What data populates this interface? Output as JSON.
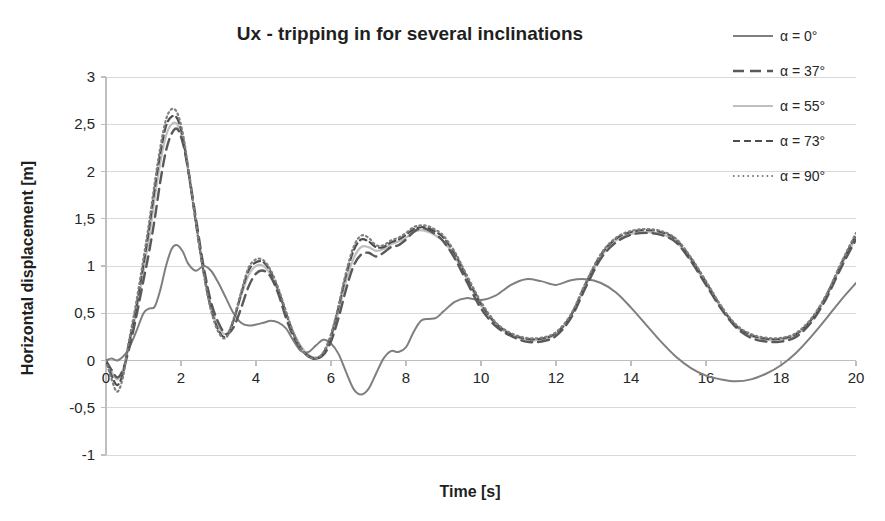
{
  "chart_data": {
    "type": "line",
    "title": "Ux - tripping in for several inclinations",
    "xlabel": "Time [s]",
    "ylabel": "Horizontal displacement [m]",
    "xlim": [
      0,
      20
    ],
    "ylim": [
      -1,
      3
    ],
    "grid": true,
    "legend_position": "right",
    "xticks": [
      0,
      2,
      4,
      6,
      8,
      10,
      12,
      14,
      16,
      18,
      20
    ],
    "xtick_labels": [
      "0",
      "2",
      "4",
      "6",
      "8",
      "10",
      "12",
      "14",
      "16",
      "18",
      "20"
    ],
    "yticks": [
      -1,
      -0.5,
      0,
      0.5,
      1,
      1.5,
      2,
      2.5,
      3
    ],
    "ytick_labels": [
      "-1",
      "-0,5",
      "0",
      "0,5",
      "1",
      "1,5",
      "2",
      "2,5",
      "3"
    ],
    "decimal_separator": ",",
    "series": [
      {
        "name": "α = 0°",
        "legend_label": "α = 0°",
        "style": "solid",
        "color": "#7f7f7f",
        "width": 2.0,
        "dasharray": "none",
        "x": [
          0,
          0.15,
          0.3,
          0.45,
          0.6,
          0.8,
          1.0,
          1.15,
          1.3,
          1.45,
          1.6,
          1.75,
          1.9,
          2.05,
          2.2,
          2.4,
          2.6,
          2.8,
          3.0,
          3.2,
          3.4,
          3.6,
          3.8,
          4.0,
          4.2,
          4.4,
          4.6,
          4.8,
          5.0,
          5.2,
          5.4,
          5.6,
          5.8,
          6.0,
          6.2,
          6.4,
          6.6,
          6.8,
          7.0,
          7.2,
          7.4,
          7.6,
          7.8,
          8.0,
          8.2,
          8.4,
          8.6,
          8.8,
          9.0,
          9.3,
          9.6,
          10.0,
          10.4,
          10.8,
          11.2,
          11.6,
          12.0,
          12.4,
          12.8,
          13.2,
          13.6,
          14.0,
          14.4,
          14.8,
          15.2,
          15.6,
          16.0,
          16.4,
          16.8,
          17.2,
          17.6,
          18.0,
          18.4,
          18.8,
          19.2,
          19.6,
          20.0
        ],
        "y": [
          0.0,
          0.02,
          0.0,
          0.04,
          0.12,
          0.3,
          0.5,
          0.55,
          0.57,
          0.75,
          1.0,
          1.18,
          1.22,
          1.15,
          1.02,
          0.95,
          1.0,
          0.95,
          0.82,
          0.66,
          0.5,
          0.4,
          0.37,
          0.38,
          0.4,
          0.42,
          0.4,
          0.34,
          0.21,
          0.1,
          0.09,
          0.16,
          0.22,
          0.18,
          0.07,
          -0.12,
          -0.3,
          -0.36,
          -0.3,
          -0.14,
          0.02,
          0.1,
          0.09,
          0.14,
          0.3,
          0.42,
          0.44,
          0.45,
          0.52,
          0.62,
          0.66,
          0.64,
          0.69,
          0.8,
          0.86,
          0.84,
          0.8,
          0.85,
          0.86,
          0.82,
          0.72,
          0.56,
          0.38,
          0.2,
          0.04,
          -0.08,
          -0.16,
          -0.2,
          -0.22,
          -0.2,
          -0.14,
          -0.05,
          0.08,
          0.25,
          0.44,
          0.64,
          0.82
        ],
        "peak_values": {
          "first_peak_t": 1.85,
          "first_peak_y": 1.22,
          "second_peak_t": 8.4,
          "second_peak_y": 0.86,
          "third_peak_t": 14.1,
          "third_peak_y": 0.86,
          "min_t": 6.8,
          "min_y": -0.36,
          "end_t": 20,
          "end_y": 0.82
        }
      },
      {
        "name": "α = 37°",
        "legend_label": "α = 37°",
        "style": "long-dash",
        "color": "#595959",
        "width": 2.4,
        "dasharray": "11,6",
        "x": [
          0,
          0.15,
          0.3,
          0.45,
          0.6,
          0.8,
          1.0,
          1.15,
          1.3,
          1.45,
          1.6,
          1.75,
          1.9,
          2.05,
          2.2,
          2.4,
          2.6,
          2.8,
          3.0,
          3.2,
          3.4,
          3.6,
          3.8,
          4.0,
          4.2,
          4.4,
          4.6,
          4.8,
          5.0,
          5.2,
          5.4,
          5.6,
          5.8,
          6.0,
          6.2,
          6.4,
          6.6,
          6.8,
          7.0,
          7.2,
          7.4,
          7.6,
          7.8,
          8.0,
          8.2,
          8.4,
          8.6,
          8.8,
          9.0,
          9.3,
          9.6,
          10.0,
          10.4,
          10.8,
          11.2,
          11.6,
          12.0,
          12.4,
          12.8,
          13.2,
          13.6,
          14.0,
          14.4,
          14.8,
          15.2,
          15.6,
          16.0,
          16.4,
          16.8,
          17.2,
          17.6,
          18.0,
          18.4,
          18.8,
          19.2,
          19.6,
          20.0
        ],
        "y": [
          0.0,
          -0.1,
          -0.18,
          -0.1,
          0.1,
          0.45,
          0.85,
          1.15,
          1.5,
          1.9,
          2.22,
          2.4,
          2.45,
          2.3,
          2.0,
          1.5,
          1.0,
          0.62,
          0.4,
          0.28,
          0.35,
          0.55,
          0.78,
          0.92,
          0.95,
          0.88,
          0.7,
          0.45,
          0.25,
          0.12,
          0.05,
          0.02,
          0.06,
          0.2,
          0.45,
          0.75,
          1.0,
          1.12,
          1.14,
          1.1,
          1.14,
          1.2,
          1.22,
          1.28,
          1.36,
          1.4,
          1.38,
          1.33,
          1.26,
          1.08,
          0.85,
          0.55,
          0.36,
          0.26,
          0.2,
          0.2,
          0.26,
          0.45,
          0.78,
          1.08,
          1.25,
          1.33,
          1.35,
          1.33,
          1.25,
          1.05,
          0.8,
          0.55,
          0.35,
          0.24,
          0.2,
          0.2,
          0.25,
          0.4,
          0.65,
          0.98,
          1.28
        ],
        "peak_values": {
          "first_peak_t": 1.85,
          "first_peak_y": 2.45,
          "second_peak_t": 8.4,
          "second_peak_y": 1.4,
          "third_peak_t": 14.4,
          "third_peak_y": 1.35,
          "min_t": 0.3,
          "min_y": -0.18,
          "end_t": 20,
          "end_y": 1.28
        }
      },
      {
        "name": "α = 55°",
        "legend_label": "α = 55°",
        "style": "light-solid",
        "color": "#bfbfbf",
        "width": 2.2,
        "dasharray": "none",
        "x": [
          0,
          0.15,
          0.3,
          0.45,
          0.6,
          0.8,
          1.0,
          1.15,
          1.3,
          1.45,
          1.6,
          1.75,
          1.9,
          2.05,
          2.2,
          2.4,
          2.6,
          2.8,
          3.0,
          3.2,
          3.4,
          3.6,
          3.8,
          4.0,
          4.2,
          4.4,
          4.6,
          4.8,
          5.0,
          5.2,
          5.4,
          5.6,
          5.8,
          6.0,
          6.2,
          6.4,
          6.6,
          6.8,
          7.0,
          7.2,
          7.4,
          7.6,
          7.8,
          8.0,
          8.2,
          8.4,
          8.6,
          8.8,
          9.0,
          9.3,
          9.6,
          10.0,
          10.4,
          10.8,
          11.2,
          11.6,
          12.0,
          12.4,
          12.8,
          13.2,
          13.6,
          14.0,
          14.4,
          14.8,
          15.2,
          15.6,
          16.0,
          16.4,
          16.8,
          17.2,
          17.6,
          18.0,
          18.4,
          18.8,
          19.2,
          19.6,
          20.0
        ],
        "y": [
          0.0,
          -0.12,
          -0.2,
          -0.1,
          0.14,
          0.5,
          0.95,
          1.3,
          1.72,
          2.1,
          2.38,
          2.5,
          2.5,
          2.33,
          1.98,
          1.45,
          0.95,
          0.58,
          0.36,
          0.28,
          0.42,
          0.68,
          0.9,
          1.0,
          1.0,
          0.9,
          0.72,
          0.5,
          0.3,
          0.15,
          0.06,
          0.03,
          0.08,
          0.24,
          0.52,
          0.84,
          1.08,
          1.2,
          1.2,
          1.16,
          1.18,
          1.23,
          1.26,
          1.3,
          1.36,
          1.38,
          1.36,
          1.32,
          1.26,
          1.1,
          0.88,
          0.58,
          0.38,
          0.27,
          0.22,
          0.22,
          0.28,
          0.47,
          0.8,
          1.1,
          1.27,
          1.34,
          1.36,
          1.34,
          1.26,
          1.06,
          0.81,
          0.56,
          0.36,
          0.26,
          0.22,
          0.22,
          0.27,
          0.42,
          0.67,
          1.0,
          1.3
        ],
        "peak_values": {
          "first_peak_t": 1.8,
          "first_peak_y": 2.51,
          "second_peak_t": 8.4,
          "second_peak_y": 1.38,
          "third_peak_t": 14.4,
          "third_peak_y": 1.36,
          "min_t": 0.3,
          "min_y": -0.2,
          "end_t": 20,
          "end_y": 1.3
        }
      },
      {
        "name": "α = 73°",
        "legend_label": "α = 73°",
        "style": "dashed",
        "color": "#4d4d4d",
        "width": 2.2,
        "dasharray": "7,4",
        "x": [
          0,
          0.15,
          0.3,
          0.45,
          0.6,
          0.8,
          1.0,
          1.15,
          1.3,
          1.45,
          1.6,
          1.75,
          1.9,
          2.05,
          2.2,
          2.4,
          2.6,
          2.8,
          3.0,
          3.2,
          3.4,
          3.6,
          3.8,
          4.0,
          4.2,
          4.4,
          4.6,
          4.8,
          5.0,
          5.2,
          5.4,
          5.6,
          5.8,
          6.0,
          6.2,
          6.4,
          6.6,
          6.8,
          7.0,
          7.2,
          7.4,
          7.6,
          7.8,
          8.0,
          8.2,
          8.4,
          8.6,
          8.8,
          9.0,
          9.3,
          9.6,
          10.0,
          10.4,
          10.8,
          11.2,
          11.6,
          12.0,
          12.4,
          12.8,
          13.2,
          13.6,
          14.0,
          14.4,
          14.8,
          15.2,
          15.6,
          16.0,
          16.4,
          16.8,
          17.2,
          17.6,
          18.0,
          18.4,
          18.8,
          19.2,
          19.6,
          20.0
        ],
        "y": [
          0.0,
          -0.16,
          -0.26,
          -0.14,
          0.16,
          0.55,
          1.02,
          1.4,
          1.82,
          2.2,
          2.48,
          2.58,
          2.56,
          2.36,
          2.0,
          1.45,
          0.94,
          0.55,
          0.32,
          0.25,
          0.42,
          0.7,
          0.95,
          1.04,
          1.04,
          0.93,
          0.74,
          0.5,
          0.28,
          0.13,
          0.04,
          0.02,
          0.08,
          0.26,
          0.56,
          0.9,
          1.16,
          1.28,
          1.26,
          1.2,
          1.2,
          1.25,
          1.28,
          1.33,
          1.39,
          1.41,
          1.4,
          1.36,
          1.3,
          1.13,
          0.9,
          0.6,
          0.39,
          0.28,
          0.23,
          0.23,
          0.29,
          0.48,
          0.82,
          1.12,
          1.29,
          1.36,
          1.38,
          1.36,
          1.28,
          1.08,
          0.83,
          0.57,
          0.37,
          0.27,
          0.23,
          0.23,
          0.28,
          0.43,
          0.68,
          1.02,
          1.33
        ],
        "peak_values": {
          "first_peak_t": 1.78,
          "first_peak_y": 2.58,
          "second_peak_t": 8.4,
          "second_peak_y": 1.41,
          "third_peak_t": 14.4,
          "third_peak_y": 1.38,
          "min_t": 0.3,
          "min_y": -0.26,
          "end_t": 20,
          "end_y": 1.33
        }
      },
      {
        "name": "α = 90°",
        "legend_label": "α = 90°",
        "style": "dotted",
        "color": "#808080",
        "width": 2.2,
        "dasharray": "1.6,3.2",
        "x": [
          0,
          0.15,
          0.3,
          0.45,
          0.6,
          0.8,
          1.0,
          1.15,
          1.3,
          1.45,
          1.6,
          1.75,
          1.9,
          2.05,
          2.2,
          2.4,
          2.6,
          2.8,
          3.0,
          3.2,
          3.4,
          3.6,
          3.8,
          4.0,
          4.2,
          4.4,
          4.6,
          4.8,
          5.0,
          5.2,
          5.4,
          5.6,
          5.8,
          6.0,
          6.2,
          6.4,
          6.6,
          6.8,
          7.0,
          7.2,
          7.4,
          7.6,
          7.8,
          8.0,
          8.2,
          8.4,
          8.6,
          8.8,
          9.0,
          9.3,
          9.6,
          10.0,
          10.4,
          10.8,
          11.2,
          11.6,
          12.0,
          12.4,
          12.8,
          13.2,
          13.6,
          14.0,
          14.4,
          14.8,
          15.2,
          15.6,
          16.0,
          16.4,
          16.8,
          17.2,
          17.6,
          18.0,
          18.4,
          18.8,
          19.2,
          19.6,
          20.0
        ],
        "y": [
          0.0,
          -0.2,
          -0.33,
          -0.18,
          0.18,
          0.6,
          1.08,
          1.46,
          1.88,
          2.26,
          2.55,
          2.66,
          2.62,
          2.4,
          2.02,
          1.46,
          0.93,
          0.53,
          0.3,
          0.24,
          0.44,
          0.72,
          0.98,
          1.07,
          1.06,
          0.95,
          0.76,
          0.52,
          0.29,
          0.13,
          0.04,
          0.02,
          0.09,
          0.28,
          0.58,
          0.93,
          1.2,
          1.32,
          1.3,
          1.22,
          1.22,
          1.27,
          1.3,
          1.35,
          1.41,
          1.43,
          1.42,
          1.38,
          1.32,
          1.15,
          0.92,
          0.62,
          0.4,
          0.29,
          0.24,
          0.24,
          0.3,
          0.49,
          0.83,
          1.13,
          1.3,
          1.37,
          1.39,
          1.37,
          1.29,
          1.09,
          0.84,
          0.58,
          0.38,
          0.28,
          0.24,
          0.24,
          0.29,
          0.44,
          0.69,
          1.03,
          1.35
        ],
        "peak_values": {
          "first_peak_t": 1.75,
          "first_peak_y": 2.66,
          "second_peak_t": 8.4,
          "second_peak_y": 1.43,
          "third_peak_t": 14.4,
          "third_peak_y": 1.39,
          "min_t": 0.3,
          "min_y": -0.33,
          "end_t": 20,
          "end_y": 1.35
        }
      }
    ]
  },
  "legend": {
    "items": [
      {
        "label": "α = 0°",
        "swatch": "solid-line-swatch"
      },
      {
        "label": "α = 37°",
        "swatch": "long-dash-line-swatch"
      },
      {
        "label": "α = 55°",
        "swatch": "light-solid-line-swatch"
      },
      {
        "label": "α = 73°",
        "swatch": "dashed-line-swatch"
      },
      {
        "label": "α = 90°",
        "swatch": "dotted-line-swatch"
      }
    ]
  },
  "colors": {
    "background": "#ffffff",
    "grid": "#d9d9d9",
    "axis": "#bfbfbf",
    "text": "#1f1f1f"
  }
}
